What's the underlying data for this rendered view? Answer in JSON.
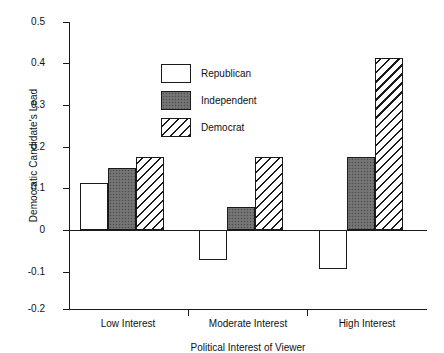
{
  "chart_data": {
    "type": "bar",
    "title": "",
    "xlabel": "Political Interest of Viewer",
    "ylabel": "Democratic Candidate's Lead",
    "categories": [
      "Low Interest",
      "Moderate Interest",
      "High Interest"
    ],
    "series": [
      {
        "name": "Republican",
        "pattern": "open",
        "values": [
          0.115,
          -0.072,
          -0.095
        ]
      },
      {
        "name": "Independent",
        "pattern": "solid",
        "values": [
          0.152,
          0.055,
          0.178
        ]
      },
      {
        "name": "Democrat",
        "pattern": "hatch",
        "values": [
          0.178,
          0.178,
          0.418
        ]
      }
    ],
    "ylim": [
      -0.2,
      0.5
    ],
    "yticks": [
      0.5,
      0.4,
      0.3,
      0.2,
      0.1,
      0,
      -0.1,
      -0.2
    ],
    "ytick_labels": [
      "0.5",
      "0.4",
      "0.3",
      "0.2",
      "0.1",
      "0",
      "-0.1",
      "-0.2"
    ],
    "grid": false,
    "zero_line": true,
    "legend_position": "upper-left-inside",
    "legend_entries": [
      "Republican",
      "Independent",
      "Democrat"
    ],
    "colors": {
      "axis": "#1a1a1a",
      "open_fill": "#ffffff",
      "solid_fill": "#6e6e6e",
      "hatch_line": "#1a1a1a",
      "background": "#ffffff"
    }
  }
}
